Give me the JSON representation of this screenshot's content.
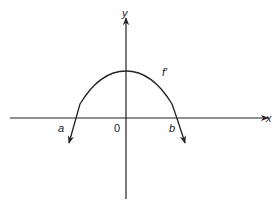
{
  "figure": {
    "type": "function-graph",
    "axes": {
      "x_label": "x",
      "y_label": "y",
      "origin_label": "0"
    },
    "curve": {
      "label": "f′",
      "shape": "downward-opening parabola",
      "vertex": "on positive y-axis"
    },
    "points": [
      {
        "label": "a",
        "position": "left x-intercept (negative)"
      },
      {
        "label": "b",
        "position": "right x-intercept (positive)"
      }
    ],
    "colors": {
      "stroke": "#222222",
      "background": "#ffffff"
    }
  }
}
